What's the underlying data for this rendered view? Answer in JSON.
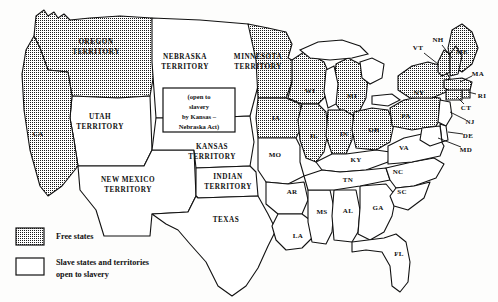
{
  "map": {
    "title": "United States 1854 — Free states and slave states",
    "colors": {
      "ink": "#111111",
      "paper": "#fdfdfc",
      "free_fill": "stipple-pattern",
      "slave_fill": "#ffffff"
    },
    "callout": {
      "name": "kansas-nebraska-act-callout",
      "lines": [
        "(open to",
        "slavery",
        "by Kansas –",
        "Nebraska Act)"
      ]
    },
    "legend": {
      "items": [
        {
          "swatch": "stipple",
          "label": "Free states",
          "lines": [
            "Free states"
          ]
        },
        {
          "swatch": "white",
          "label": "Slave states and territories open to slavery",
          "lines": [
            "Slave states and territories",
            "open to slavery"
          ]
        }
      ]
    },
    "regions": [
      {
        "id": "oregon-territory",
        "label": "OREGON",
        "label2": "TERRITORY",
        "status": "free",
        "lx": 96,
        "ly": 47,
        "style": "terr",
        "d": "M36 16 L44 10 L48 16 L54 12 L58 18 L64 14 L70 20 L90 18 L120 16 L152 18 L156 62 L150 96 L118 98 L72 96 L68 72 L48 70 L40 48 L34 36 Z"
      },
      {
        "id": "utah-territory",
        "label": "UTAH",
        "label2": "TERRITORY",
        "status": "slave",
        "lx": 100,
        "ly": 122,
        "style": "terr",
        "d": "M72 96 L118 98 L150 96 L152 150 L144 166 L78 166 L74 140 L70 118 Z"
      },
      {
        "id": "california",
        "label": "CA",
        "status": "free",
        "lx": 38,
        "ly": 134,
        "style": "small",
        "d": "M34 36 L40 48 L48 70 L68 72 L72 96 L70 118 L74 140 L78 166 L62 186 L48 196 L40 186 L30 150 L24 110 L22 74 L26 50 Z"
      },
      {
        "id": "new-mexico-territory",
        "label": "NEW MEXICO",
        "label2": "TERRITORY",
        "status": "slave",
        "lx": 128,
        "ly": 185,
        "style": "terr",
        "d": "M78 166 L144 166 L152 150 L194 150 L196 196 L188 212 L152 214 L150 236 L104 236 L96 210 L80 190 Z"
      },
      {
        "id": "nebraska-territory",
        "label": "NEBRASKA",
        "label2": "TERRITORY",
        "status": "slave",
        "lx": 185,
        "ly": 62,
        "style": "terr",
        "d": "M152 18 L200 20 L248 24 L256 36 L258 86 L250 116 L200 118 L156 118 L152 62 Z"
      },
      {
        "id": "kansas-territory",
        "label": "KANSAS",
        "label2": "TERRITORY",
        "status": "slave",
        "lx": 212,
        "ly": 152,
        "style": "terr",
        "d": "M156 118 L200 118 L250 116 L254 142 L250 166 L196 168 L194 150 L152 150 Z"
      },
      {
        "id": "indian-territory",
        "label": "INDIAN",
        "label2": "TERRITORY",
        "status": "slave",
        "lx": 228,
        "ly": 182,
        "style": "terr",
        "d": "M196 168 L250 166 L256 172 L258 196 L198 198 L196 196 Z"
      },
      {
        "id": "texas",
        "label": "TEXAS",
        "status": "slave",
        "lx": 226,
        "ly": 220,
        "style": "terr",
        "d": "M198 198 L258 196 L268 214 L276 230 L268 246 L258 268 L246 286 L232 296 L218 286 L206 262 L190 244 L178 230 L166 224 L152 214 L188 212 L196 196 Z"
      },
      {
        "id": "minnesota-territory",
        "label": "MINNESOTA",
        "label2": "TERRITORY",
        "status": "free",
        "lx": 258,
        "ly": 62,
        "style": "terr",
        "d": "M248 24 L268 28 L286 32 L292 44 L288 58 L296 62 L292 82 L286 98 L258 98 L256 60 Z"
      },
      {
        "id": "iowa",
        "label": "IA",
        "status": "free",
        "lx": 276,
        "ly": 118,
        "style": "small",
        "d": "M258 98 L286 98 L300 104 L302 126 L296 138 L258 138 L256 118 Z"
      },
      {
        "id": "wisconsin",
        "label": "WI",
        "status": "free",
        "lx": 310,
        "ly": 91,
        "style": "small",
        "d": "M292 60 L304 52 L314 56 L324 62 L330 76 L326 96 L318 104 L302 104 L288 98 L292 82 Z"
      },
      {
        "id": "michigan",
        "label": "MI",
        "status": "free",
        "lx": 352,
        "ly": 96,
        "style": "small",
        "d": "M336 64 L348 58 L360 64 L368 78 L366 98 L358 114 L344 116 L336 104 L334 84 Z"
      },
      {
        "id": "illinois",
        "label": "IL",
        "status": "free",
        "lx": 314,
        "ly": 136,
        "style": "small",
        "d": "M302 104 L318 104 L326 112 L328 132 L324 152 L316 162 L306 158 L300 140 L298 120 Z"
      },
      {
        "id": "indiana",
        "label": "IN",
        "status": "free",
        "lx": 344,
        "ly": 134,
        "style": "small",
        "d": "M328 110 L344 110 L354 116 L352 140 L346 154 L332 154 L326 136 Z"
      },
      {
        "id": "ohio",
        "label": "OH",
        "status": "free",
        "lx": 374,
        "ly": 130,
        "style": "small",
        "d": "M354 112 L372 108 L388 110 L394 124 L390 142 L376 150 L356 148 L352 130 Z"
      },
      {
        "id": "missouri",
        "label": "MO",
        "status": "slave",
        "lx": 275,
        "ly": 155,
        "style": "small",
        "d": "M258 138 L296 138 L300 146 L300 162 L304 176 L288 184 L266 182 L258 170 Z"
      },
      {
        "id": "arkansas",
        "label": "AR",
        "status": "slave",
        "lx": 292,
        "ly": 192,
        "style": "small",
        "d": "M266 182 L288 184 L304 182 L308 200 L302 214 L278 214 L266 204 Z"
      },
      {
        "id": "louisiana",
        "label": "LA",
        "status": "slave",
        "lx": 298,
        "ly": 236,
        "style": "small",
        "d": "M278 214 L302 214 L310 220 L312 238 L302 248 L286 250 L276 240 L272 226 Z"
      },
      {
        "id": "mississippi",
        "label": "MS",
        "status": "slave",
        "lx": 322,
        "ly": 212,
        "style": "small",
        "d": "M308 190 L330 190 L334 208 L332 232 L326 244 L312 242 L308 222 Z"
      },
      {
        "id": "alabama",
        "label": "AL",
        "status": "slave",
        "lx": 348,
        "ly": 211,
        "style": "small",
        "d": "M334 190 L356 190 L360 210 L358 232 L352 242 L334 240 L332 216 Z"
      },
      {
        "id": "georgia",
        "label": "GA",
        "status": "slave",
        "lx": 378,
        "ly": 208,
        "style": "small",
        "d": "M360 186 L386 184 L396 196 L392 216 L384 232 L370 240 L358 234 L360 208 Z"
      },
      {
        "id": "florida",
        "label": "FL",
        "status": "slave",
        "lx": 399,
        "ly": 254,
        "style": "small",
        "d": "M352 242 L384 238 L396 234 L406 242 L410 262 L408 282 L400 292 L392 286 L390 266 L382 252 L366 250 L352 252 Z"
      },
      {
        "id": "kentucky",
        "label": "KY",
        "status": "slave",
        "lx": 356,
        "ly": 160,
        "style": "small",
        "d": "M316 162 L332 154 L346 154 L376 150 L390 152 L388 162 L366 170 L340 172 L322 170 Z"
      },
      {
        "id": "tennessee",
        "label": "TN",
        "status": "slave",
        "lx": 348,
        "ly": 180,
        "style": "small",
        "d": "M304 176 L322 170 L340 172 L366 170 L386 168 L390 180 L360 186 L334 190 L308 190 Z"
      },
      {
        "id": "north-carolina",
        "label": "NC",
        "status": "slave",
        "lx": 398,
        "ly": 172,
        "style": "small",
        "d": "M386 168 L412 162 L434 158 L444 164 L436 178 L414 186 L396 188 L390 180 Z"
      },
      {
        "id": "south-carolina",
        "label": "SC",
        "status": "slave",
        "lx": 402,
        "ly": 192,
        "style": "small",
        "d": "M396 188 L414 186 L430 182 L424 198 L408 210 L394 206 L390 196 Z"
      },
      {
        "id": "virginia",
        "label": "VA",
        "status": "slave",
        "lx": 404,
        "ly": 148,
        "style": "small",
        "d": "M388 146 L404 138 L422 134 L438 136 L444 146 L440 156 L412 162 L388 164 Z"
      },
      {
        "id": "pennsylvania",
        "label": "PA",
        "status": "free",
        "lx": 406,
        "ly": 116,
        "style": "small",
        "d": "M390 108 L404 100 L424 96 L440 98 L444 112 L436 126 L412 130 L392 126 Z"
      },
      {
        "id": "new-york",
        "label": "NY",
        "status": "free",
        "lx": 419,
        "ly": 93,
        "style": "small",
        "d": "M398 76 L412 66 L428 62 L442 66 L450 78 L446 92 L432 98 L410 98 L398 90 Z"
      },
      {
        "id": "maine",
        "label": "ME",
        "status": "free",
        "lx": 462,
        "ly": 52,
        "style": "small",
        "d": "M452 30 L462 24 L472 32 L478 48 L472 64 L462 72 L452 66 L448 48 Z"
      },
      {
        "id": "vermont",
        "label": "VT",
        "status": "free",
        "lx": 418,
        "ly": 48,
        "style": "small",
        "d": "M438 62 L444 50 L450 54 L450 72 L442 76 L438 72 Z"
      },
      {
        "id": "new-hampshire",
        "label": "NH",
        "status": "free",
        "lx": 438,
        "ly": 40,
        "style": "small",
        "d": "M450 54 L456 46 L462 56 L458 74 L450 76 Z"
      },
      {
        "id": "massachusetts",
        "label": "MA",
        "status": "free",
        "lx": 478,
        "ly": 74,
        "style": "small",
        "d": "M444 80 L462 78 L472 82 L470 90 L452 92 L444 88 Z"
      },
      {
        "id": "rhode-island",
        "label": "RI",
        "status": "free",
        "lx": 482,
        "ly": 96,
        "style": "small",
        "d": "M462 90 L470 90 L470 98 L462 98 Z"
      },
      {
        "id": "connecticut",
        "label": "CT",
        "status": "free",
        "lx": 466,
        "ly": 108,
        "style": "small",
        "d": "M446 90 L462 90 L462 100 L446 100 Z"
      },
      {
        "id": "new-jersey",
        "label": "NJ",
        "status": "slave",
        "lx": 470,
        "ly": 122,
        "style": "small",
        "d": "M440 100 L450 102 L452 116 L446 126 L438 122 Z"
      },
      {
        "id": "delaware",
        "label": "DE",
        "status": "slave",
        "lx": 468,
        "ly": 136,
        "style": "small",
        "d": "M440 124 L446 126 L448 140 L442 142 Z"
      },
      {
        "id": "maryland",
        "label": "MD",
        "status": "slave",
        "lx": 466,
        "ly": 150,
        "style": "small",
        "d": "M422 128 L440 126 L442 142 L430 146 L420 140 Z"
      }
    ],
    "leaders": [
      {
        "id": "leader-vt",
        "d": "M424 53 L438 64"
      },
      {
        "id": "leader-nh",
        "d": "M442 45 L452 58"
      },
      {
        "id": "leader-ma",
        "d": "M472 76 L460 82"
      },
      {
        "id": "leader-ri",
        "d": "M476 94 L468 92"
      },
      {
        "id": "leader-ct",
        "d": "M464 104 L456 96"
      },
      {
        "id": "leader-nj",
        "d": "M466 120 L450 112"
      },
      {
        "id": "leader-de",
        "d": "M463 134 L448 132"
      },
      {
        "id": "leader-md",
        "d": "M461 147 L438 138"
      }
    ],
    "lakes": [
      {
        "id": "lake-superior",
        "d": "M300 50 L318 42 L342 40 L360 46 L368 54 L352 58 L330 60 L310 58 Z"
      },
      {
        "id": "lake-michigan",
        "d": "M326 70 L334 66 L338 84 L336 104 L328 108 L324 92 Z"
      },
      {
        "id": "lake-huron-erie",
        "d": "M360 62 L372 58 L384 64 L382 78 L370 84 L362 78 Z"
      },
      {
        "id": "lake-erie",
        "d": "M372 96 L392 94 L400 100 L388 106 L372 104 Z"
      }
    ]
  }
}
